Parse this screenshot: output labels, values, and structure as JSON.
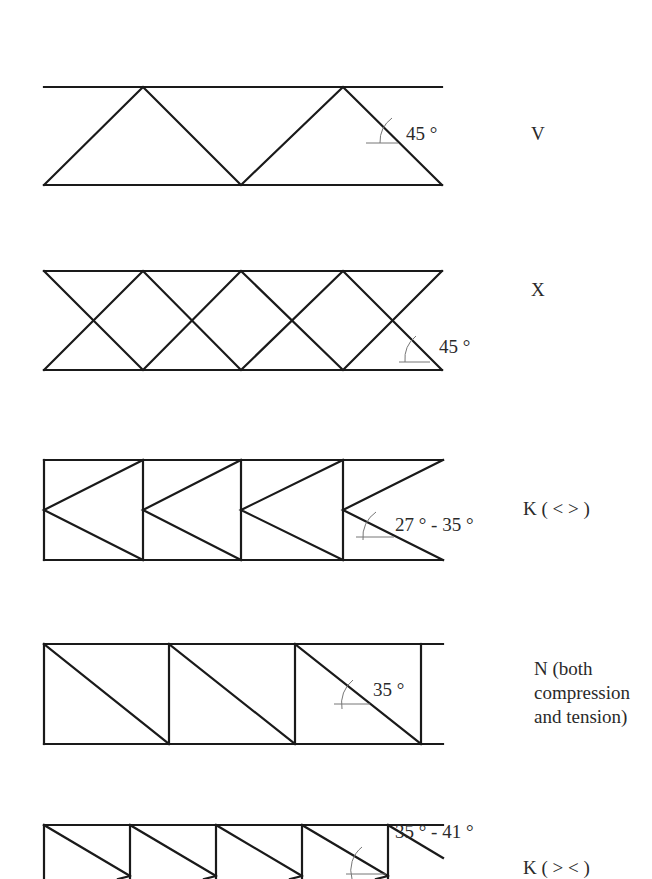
{
  "trusses": [
    {
      "type_label": "V",
      "angle_label": "45 °"
    },
    {
      "type_label": "X",
      "angle_label": "45 °"
    },
    {
      "type_label": "K ( < > )",
      "angle_label": "27 ° -  35 °"
    },
    {
      "type_label_lines": [
        "N (both",
        "compression",
        "and tension)"
      ],
      "angle_label": "35 °"
    },
    {
      "type_label": "K ( > < )",
      "angle_label": "35 ° - 41 °"
    }
  ],
  "colors": {
    "line": "#1a1a1a",
    "text": "#2a2a2a",
    "arc": "#777777"
  }
}
